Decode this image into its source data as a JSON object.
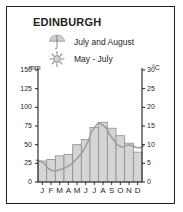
{
  "card": {
    "title": "EDINBURGH"
  },
  "legend": [
    {
      "icon": "umbrella-icon",
      "label": "July and August"
    },
    {
      "icon": "sun-icon",
      "label": "May - July"
    }
  ],
  "axes": {
    "left_unit": "mm",
    "right_unit": "°C",
    "left_ticks": [
      "150",
      "125",
      "100",
      "75",
      "50",
      "25",
      "0"
    ],
    "right_ticks": [
      "30",
      "25",
      "20",
      "15",
      "10",
      "5",
      "0"
    ]
  },
  "chart_data": {
    "type": "bar",
    "title": "EDINBURGH",
    "xlabel": "",
    "ylabel": "mm",
    "ylim": [
      0,
      150
    ],
    "y2label": "°C",
    "y2lim": [
      0,
      30
    ],
    "grid": false,
    "legend_position": "top-left",
    "categories": [
      "J",
      "F",
      "M",
      "A",
      "M",
      "J",
      "J",
      "A",
      "S",
      "O",
      "N",
      "D"
    ],
    "series": [
      {
        "name": "Precipitation",
        "type": "bar",
        "unit": "mm",
        "axis": "left",
        "values": [
          28,
          30,
          35,
          37,
          50,
          57,
          73,
          80,
          72,
          62,
          52,
          40
        ]
      },
      {
        "name": "Temperature",
        "type": "line",
        "unit": "°C",
        "axis": "right",
        "values": [
          5.3,
          3.2,
          3.3,
          4.3,
          6.3,
          9.6,
          14.5,
          15.2,
          12.0,
          9.5,
          9.9,
          9.2
        ]
      }
    ]
  }
}
